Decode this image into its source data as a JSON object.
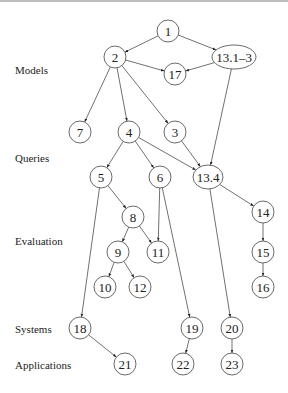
{
  "levels": [
    {
      "label": "Models",
      "x": 15,
      "y": 74
    },
    {
      "label": "Queries",
      "x": 15,
      "y": 162
    },
    {
      "label": "Evaluation",
      "x": 15,
      "y": 245
    },
    {
      "label": "Systems",
      "x": 15,
      "y": 333
    },
    {
      "label": "Applications",
      "x": 15,
      "y": 369
    }
  ],
  "nodes": [
    {
      "id": "1",
      "label": "1",
      "x": 168,
      "y": 31,
      "rx": 11,
      "ry": 11
    },
    {
      "id": "2",
      "label": "2",
      "x": 115,
      "y": 57,
      "rx": 11,
      "ry": 11
    },
    {
      "id": "13.1-3",
      "label": "13.1–3",
      "x": 234,
      "y": 57,
      "rx": 22,
      "ry": 12
    },
    {
      "id": "17",
      "label": "17",
      "x": 175,
      "y": 74,
      "rx": 11,
      "ry": 11
    },
    {
      "id": "7",
      "label": "7",
      "x": 80,
      "y": 132,
      "rx": 11,
      "ry": 11
    },
    {
      "id": "4",
      "label": "4",
      "x": 129,
      "y": 132,
      "rx": 11,
      "ry": 11
    },
    {
      "id": "3",
      "label": "3",
      "x": 175,
      "y": 132,
      "rx": 11,
      "ry": 11
    },
    {
      "id": "5",
      "label": "5",
      "x": 101,
      "y": 177,
      "rx": 11,
      "ry": 11
    },
    {
      "id": "6",
      "label": "6",
      "x": 160,
      "y": 177,
      "rx": 11,
      "ry": 11
    },
    {
      "id": "13.4",
      "label": "13.4",
      "x": 208,
      "y": 177,
      "rx": 15,
      "ry": 12
    },
    {
      "id": "8",
      "label": "8",
      "x": 133,
      "y": 217,
      "rx": 11,
      "ry": 11
    },
    {
      "id": "14",
      "label": "14",
      "x": 263,
      "y": 212,
      "rx": 11,
      "ry": 11
    },
    {
      "id": "9",
      "label": "9",
      "x": 118,
      "y": 252,
      "rx": 11,
      "ry": 11
    },
    {
      "id": "11",
      "label": "11",
      "x": 158,
      "y": 252,
      "rx": 11,
      "ry": 11
    },
    {
      "id": "15",
      "label": "15",
      "x": 263,
      "y": 252,
      "rx": 11,
      "ry": 11
    },
    {
      "id": "10",
      "label": "10",
      "x": 105,
      "y": 287,
      "rx": 11,
      "ry": 11
    },
    {
      "id": "12",
      "label": "12",
      "x": 140,
      "y": 287,
      "rx": 11,
      "ry": 11
    },
    {
      "id": "16",
      "label": "16",
      "x": 263,
      "y": 287,
      "rx": 11,
      "ry": 11
    },
    {
      "id": "18",
      "label": "18",
      "x": 80,
      "y": 328,
      "rx": 11,
      "ry": 11
    },
    {
      "id": "19",
      "label": "19",
      "x": 192,
      "y": 328,
      "rx": 11,
      "ry": 11
    },
    {
      "id": "20",
      "label": "20",
      "x": 232,
      "y": 328,
      "rx": 11,
      "ry": 11
    },
    {
      "id": "21",
      "label": "21",
      "x": 125,
      "y": 364,
      "rx": 11,
      "ry": 11
    },
    {
      "id": "22",
      "label": "22",
      "x": 183,
      "y": 364,
      "rx": 11,
      "ry": 11
    },
    {
      "id": "23",
      "label": "23",
      "x": 232,
      "y": 364,
      "rx": 11,
      "ry": 11
    }
  ],
  "edges": [
    [
      "1",
      "2"
    ],
    [
      "1",
      "13.1-3"
    ],
    [
      "2",
      "17"
    ],
    [
      "13.1-3",
      "17"
    ],
    [
      "2",
      "7"
    ],
    [
      "2",
      "4"
    ],
    [
      "2",
      "3"
    ],
    [
      "13.1-3",
      "13.4"
    ],
    [
      "4",
      "5"
    ],
    [
      "4",
      "6"
    ],
    [
      "4",
      "13.4"
    ],
    [
      "3",
      "13.4"
    ],
    [
      "5",
      "8"
    ],
    [
      "5",
      "18"
    ],
    [
      "6",
      "11"
    ],
    [
      "6",
      "19"
    ],
    [
      "13.4",
      "14"
    ],
    [
      "13.4",
      "20"
    ],
    [
      "8",
      "9"
    ],
    [
      "8",
      "11"
    ],
    [
      "9",
      "10"
    ],
    [
      "9",
      "12"
    ],
    [
      "14",
      "15"
    ],
    [
      "15",
      "16"
    ],
    [
      "18",
      "21"
    ],
    [
      "19",
      "22"
    ],
    [
      "20",
      "23"
    ]
  ]
}
